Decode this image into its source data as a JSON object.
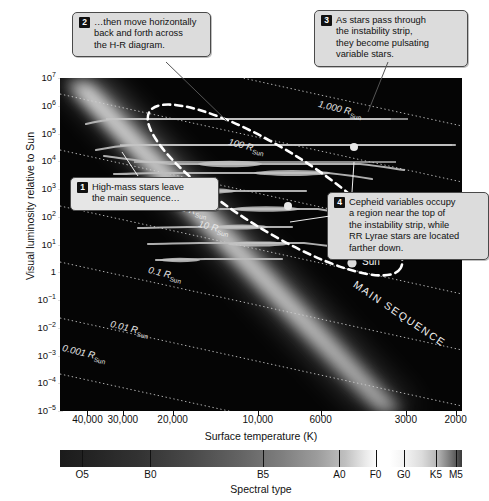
{
  "chart_data": {
    "type": "scatter",
    "xlabel": "Surface temperature (K)",
    "ylabel": "Visual luminosity relative to Sun",
    "x_tick_labels": [
      "40,000",
      "30,000",
      "20,000",
      "10,000",
      "6000",
      "3000",
      "2000"
    ],
    "x_tick_values": [
      40000,
      30000,
      20000,
      10000,
      6000,
      3000,
      2000
    ],
    "x_axis_inverted": true,
    "xlim": [
      50000,
      1900
    ],
    "y_tick_labels": [
      "10^7",
      "10^6",
      "10^5",
      "10^4",
      "10^3",
      "10^2",
      "10^1",
      "1",
      "10^-1",
      "10^-2",
      "10^-3",
      "10^-4",
      "10^-5"
    ],
    "y_tick_exponents": [
      7,
      6,
      5,
      4,
      3,
      2,
      1,
      0,
      -1,
      -2,
      -3,
      -4,
      -5
    ],
    "ylim": [
      1e-05,
      10000000.0
    ],
    "grid": false,
    "legend": "none",
    "radius_lines": [
      {
        "label": "1,000 R",
        "sub": "Sun",
        "value": 1000
      },
      {
        "label": "100 R",
        "sub": "Sun",
        "value": 100
      },
      {
        "label": "10 R",
        "sub": "Sun",
        "value": 10
      },
      {
        "label": "1 R",
        "sub": "Sun",
        "value": 1
      },
      {
        "label": "0.1 R",
        "sub": "Sun",
        "value": 0.1
      },
      {
        "label": "0.01 R",
        "sub": "Sun",
        "value": 0.01
      },
      {
        "label": "0.001 R",
        "sub": "Sun",
        "value": 0.001
      }
    ],
    "annotations": [
      {
        "name": "main-sequence",
        "text": "MAIN SEQUENCE"
      },
      {
        "name": "sun-marker",
        "text": "Sun",
        "temperature": 5800,
        "luminosity": 1
      },
      {
        "name": "instability-strip",
        "text": ""
      }
    ],
    "markers": [
      {
        "name": "cepheid-marker",
        "temperature": 6400,
        "luminosity": 3000
      },
      {
        "name": "rr-lyrae-marker",
        "temperature": 8200,
        "luminosity": 100
      }
    ]
  },
  "ylabel": "Visual luminosity relative to Sun",
  "xlabel": "Surface temperature (K)",
  "spectral": {
    "label": "Spectral type",
    "ticks": [
      "O5",
      "B0",
      "B5",
      "A0",
      "F0",
      "G0",
      "K5",
      "M5"
    ]
  },
  "yticks": [
    {
      "base": "10",
      "exp": "7"
    },
    {
      "base": "10",
      "exp": "6"
    },
    {
      "base": "10",
      "exp": "5"
    },
    {
      "base": "10",
      "exp": "4"
    },
    {
      "base": "10",
      "exp": "3"
    },
    {
      "base": "10",
      "exp": "2"
    },
    {
      "base": "10",
      "exp": "1"
    },
    {
      "base": "1",
      "exp": ""
    },
    {
      "base": "10",
      "exp": "−1"
    },
    {
      "base": "10",
      "exp": "−2"
    },
    {
      "base": "10",
      "exp": "−3"
    },
    {
      "base": "10",
      "exp": "−4"
    },
    {
      "base": "10",
      "exp": "−5"
    }
  ],
  "xticks": [
    "40,000",
    "30,000",
    "20,000",
    "10,000",
    "6000",
    "3000",
    "2000"
  ],
  "callouts": [
    {
      "num": "1",
      "lines": [
        "High-mass stars leave",
        "the main sequence…"
      ]
    },
    {
      "num": "2",
      "lines": [
        "…then move horizontally",
        "back and forth across",
        "the H-R diagram."
      ]
    },
    {
      "num": "3",
      "lines": [
        "As stars pass through",
        "the instability strip,",
        "they become pulsating",
        "variable stars."
      ]
    },
    {
      "num": "4",
      "lines": [
        "Cepheid variables occupy",
        "a region near the top of",
        "the instability strip, while",
        "RR Lyrae stars are located",
        "farther down."
      ]
    }
  ],
  "plot_labels": {
    "main_sequence": "MAIN SEQUENCE",
    "sun": "Sun",
    "r1000": "1,000 R",
    "r100": "100 R",
    "r10": "10 R",
    "r1": "1 R",
    "r01": "0.1 R",
    "r001": "0.01 R",
    "r0001": "0.001 R",
    "rsub": "Sun"
  },
  "colors": {
    "plot_background": "#050505",
    "callout_background": "#dcdcdc",
    "callout_border": "#4a4a4a",
    "track_line": "#b9b9b9",
    "radius_line": "#cfcfcf",
    "instability_strip": "#ffffff",
    "page_background": "#ffffff"
  }
}
